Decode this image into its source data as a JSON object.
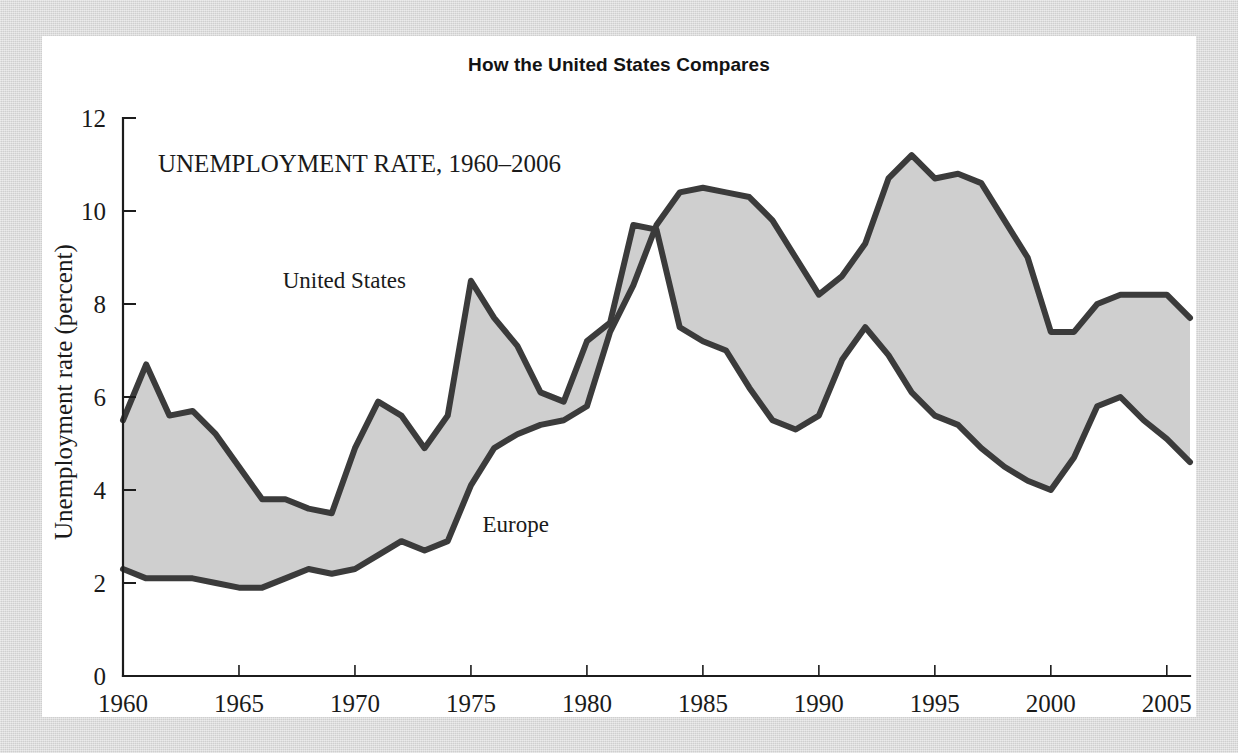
{
  "figure": {
    "title": "How the United States Compares",
    "annotation": "UNEMPLOYMENT RATE, 1960–2006",
    "background_color": "#d7d7d7",
    "panel_color": "#ffffff",
    "band_color": "#cfcfcf",
    "line_color": "#3b3b3b"
  },
  "chart_data": {
    "type": "line",
    "title": "How the United States Compares",
    "subtitle": "UNEMPLOYMENT RATE, 1960–2006",
    "xlabel": "",
    "ylabel": "Unemployment rate (percent)",
    "xlim": [
      1960,
      2006
    ],
    "ylim": [
      0,
      12
    ],
    "ytick_labels": [
      "0",
      "2",
      "4",
      "6",
      "8",
      "10",
      "12"
    ],
    "yticks": [
      0,
      2,
      4,
      6,
      8,
      10,
      12
    ],
    "xtick_labels": [
      "1960",
      "1965",
      "1970",
      "1975",
      "1980",
      "1985",
      "1990",
      "1995",
      "2000",
      "2005"
    ],
    "xticks": [
      1960,
      1965,
      1970,
      1975,
      1980,
      1985,
      1990,
      1995,
      2000,
      2005
    ],
    "grid": false,
    "legend": "inline-annotations",
    "shaded_between_series": true,
    "x": [
      1960,
      1961,
      1962,
      1963,
      1964,
      1965,
      1966,
      1967,
      1968,
      1969,
      1970,
      1971,
      1972,
      1973,
      1974,
      1975,
      1976,
      1977,
      1978,
      1979,
      1980,
      1981,
      1982,
      1983,
      1984,
      1985,
      1986,
      1987,
      1988,
      1989,
      1990,
      1991,
      1992,
      1993,
      1994,
      1995,
      1996,
      1997,
      1998,
      1999,
      2000,
      2001,
      2002,
      2003,
      2004,
      2005,
      2006
    ],
    "series": [
      {
        "name": "United States",
        "label_position": {
          "x": 1972.2,
          "y": 8.35
        },
        "values": [
          5.5,
          6.7,
          5.6,
          5.7,
          5.2,
          4.5,
          3.8,
          3.8,
          3.6,
          3.5,
          4.9,
          5.9,
          5.6,
          4.9,
          5.6,
          8.5,
          7.7,
          7.1,
          6.1,
          5.9,
          7.2,
          7.6,
          9.7,
          9.6,
          7.5,
          7.2,
          7.0,
          6.2,
          5.5,
          5.3,
          5.6,
          6.8,
          7.5,
          6.9,
          6.1,
          5.6,
          5.4,
          4.9,
          4.5,
          4.2,
          4.0,
          4.7,
          5.8,
          6.0,
          5.5,
          5.1,
          4.6
        ]
      },
      {
        "name": "Europe",
        "label_position": {
          "x": 1975.5,
          "y": 3.1
        },
        "values": [
          2.3,
          2.1,
          2.1,
          2.1,
          2.0,
          1.9,
          1.9,
          2.1,
          2.3,
          2.2,
          2.3,
          2.6,
          2.9,
          2.7,
          2.9,
          4.1,
          4.9,
          5.2,
          5.4,
          5.5,
          5.8,
          7.4,
          8.4,
          9.7,
          10.4,
          10.5,
          10.4,
          10.3,
          9.8,
          9.0,
          8.2,
          8.6,
          9.3,
          10.7,
          11.2,
          10.7,
          10.8,
          10.6,
          9.8,
          9.0,
          7.4,
          7.4,
          8.0,
          8.2,
          8.2,
          8.2,
          7.7
        ]
      }
    ]
  }
}
